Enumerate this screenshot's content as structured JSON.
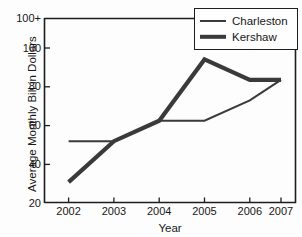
{
  "chart_data": {
    "type": "line",
    "title": "",
    "xlabel": "Year",
    "ylabel": "Average Monthly Bill in Dollars",
    "categories": [
      "2002",
      "2003",
      "2004",
      "2005",
      "2006",
      "2007"
    ],
    "series": [
      {
        "name": "Charleston",
        "values": [
          50,
          50,
          60,
          60,
          70,
          80
        ],
        "line_width": "thin"
      },
      {
        "name": "Kershaw",
        "values": [
          30,
          50,
          60,
          90,
          80,
          80
        ],
        "line_width": "thick"
      }
    ],
    "ylim": [
      20,
      110
    ],
    "yticks": [
      20,
      40,
      60,
      80,
      100
    ],
    "ytick_labels": [
      "20",
      "40",
      "60",
      "80",
      "100"
    ],
    "ytop_label": "100+",
    "grid": false,
    "legend_position": "top-right",
    "line_color": "#3a3a3a",
    "axis_color": "#1d1d1d"
  },
  "axes": {
    "y_title": "Average Monthly Bill in Dollars",
    "x_title": "Year",
    "y_labels": [
      "100+",
      "100",
      "80",
      "60",
      "40",
      "20"
    ],
    "x_labels": [
      "2002",
      "2003",
      "2004",
      "2005",
      "2006",
      "2007"
    ]
  },
  "legend": {
    "items": [
      {
        "label": "Charleston",
        "style": "thin"
      },
      {
        "label": "Kershaw",
        "style": "thick"
      }
    ]
  }
}
